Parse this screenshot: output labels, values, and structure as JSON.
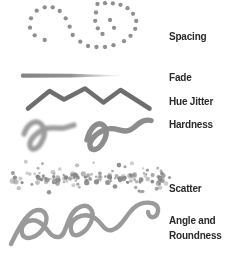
{
  "canvas": {
    "width": 232,
    "height": 256,
    "background": "#ffffff"
  },
  "labels": {
    "spacing": "Spacing",
    "fade": "Fade",
    "hue_jitter": "Hue Jitter",
    "hardness": "Hardness",
    "scatter": "Scatter",
    "angle_line1": "Angle and",
    "angle_line2": "Roundness"
  },
  "palette": {
    "label_text": "#2a2a2a",
    "dot_gray": "#8f8f8f",
    "fade_gray": "#787878",
    "zigzag_gray": "#6e6e6e",
    "soft_gray": "#9c9c9c",
    "hard_gray": "#8d8d8d",
    "scatter_gray": "#868686",
    "squiggle_gray": "#9a9a9a"
  },
  "strokes": {
    "spacing": {
      "radius": 2.15,
      "color": "#8f8f8f",
      "dots": [
        [
          36.7,
          10.7
        ],
        [
          44.7,
          7.3
        ],
        [
          52.7,
          7.3
        ],
        [
          59.7,
          11
        ],
        [
          65.7,
          18.3
        ],
        [
          69.7,
          26.7
        ],
        [
          31,
          18.3
        ],
        [
          30,
          27.7
        ],
        [
          34.7,
          35.3
        ],
        [
          44.7,
          40
        ],
        [
          72.7,
          35
        ],
        [
          80.3,
          41.7
        ],
        [
          88,
          46
        ],
        [
          96.5,
          47
        ],
        [
          105,
          47
        ],
        [
          113.5,
          45.2
        ],
        [
          97.5,
          4
        ],
        [
          105,
          3.2
        ],
        [
          112.8,
          3.4
        ],
        [
          120.5,
          4.8
        ],
        [
          127.5,
          8.2
        ],
        [
          133,
          13.8
        ],
        [
          136.2,
          21
        ],
        [
          135.2,
          28.8
        ],
        [
          130.5,
          35.8
        ],
        [
          124,
          41.2
        ],
        [
          96,
          12.5
        ],
        [
          95.2,
          20.8
        ],
        [
          97.8,
          28.3
        ],
        [
          102.5,
          34
        ],
        [
          110,
          20
        ],
        [
          114,
          27.8
        ]
      ]
    },
    "fade": {
      "x1": 22,
      "x2": 120,
      "y": 75.6,
      "w1": 4.8,
      "w2": 0.8,
      "color": "#787878"
    },
    "hue_jitter": {
      "width": 4.6,
      "color": "#6e6e6e",
      "points": [
        [
          28,
          108.5
        ],
        [
          49.5,
          91
        ],
        [
          64,
          99.5
        ],
        [
          85,
          88.5
        ],
        [
          103.5,
          102.5
        ],
        [
          120.5,
          90
        ],
        [
          149.5,
          108.5
        ]
      ]
    },
    "hardness": {
      "left": {
        "width": 5.2,
        "color": "#9c9c9c",
        "blur": "soft",
        "path": "M 24,134 C 28,123 36,119 41,124 C 46,129 45,136 41,143 C 37,150 31,151 30,146 C 29,141 34,135 42,130 C 50,126 58,129 64,128 C 68,127 71,126 74,125"
      },
      "right": {
        "width": 5.4,
        "color": "#8d8d8d",
        "blur": "crisp",
        "path": "M 87,140 C 90,128 97,121 103,125 C 108,129 107,137 102,144 C 97,151 91,151 90,146 C 89,141 95,134 104,130 C 113,126 119,131 126,131 C 133,131 136,124 143,121 C 146,120 149,120 151,120.5"
      }
    },
    "scatter": {
      "seed": 13,
      "count_band": 85,
      "count_spread": 55,
      "x_min": 11,
      "x_max": 166,
      "y_center": 178.5,
      "band_half": 7,
      "spread_half": 20,
      "r_min": 1.1,
      "r_max": 2.7,
      "color": "#868686",
      "stray_dot": [
        169.5,
        177.5
      ]
    },
    "angle_roundness": {
      "width": 4.4,
      "color": "#9a9a9a",
      "path": "M 11,244 C 16,234 24,216 34,211 C 44,207 50,216 44,227 C 38,238 24,242 22,233 C 20,224 30,217 39,222 C 48,227 49,238 59,237 C 67,236 66,215 78,208 C 88,202 96,210 91,222 C 86,233 73,241 71,230 C 69,219 82,212 93,217 C 102,221 103,232 112,230 C 124,227 128,208 140,204 C 149,201 159,203 158,211 C 157,218 149,220 148,212"
    }
  }
}
